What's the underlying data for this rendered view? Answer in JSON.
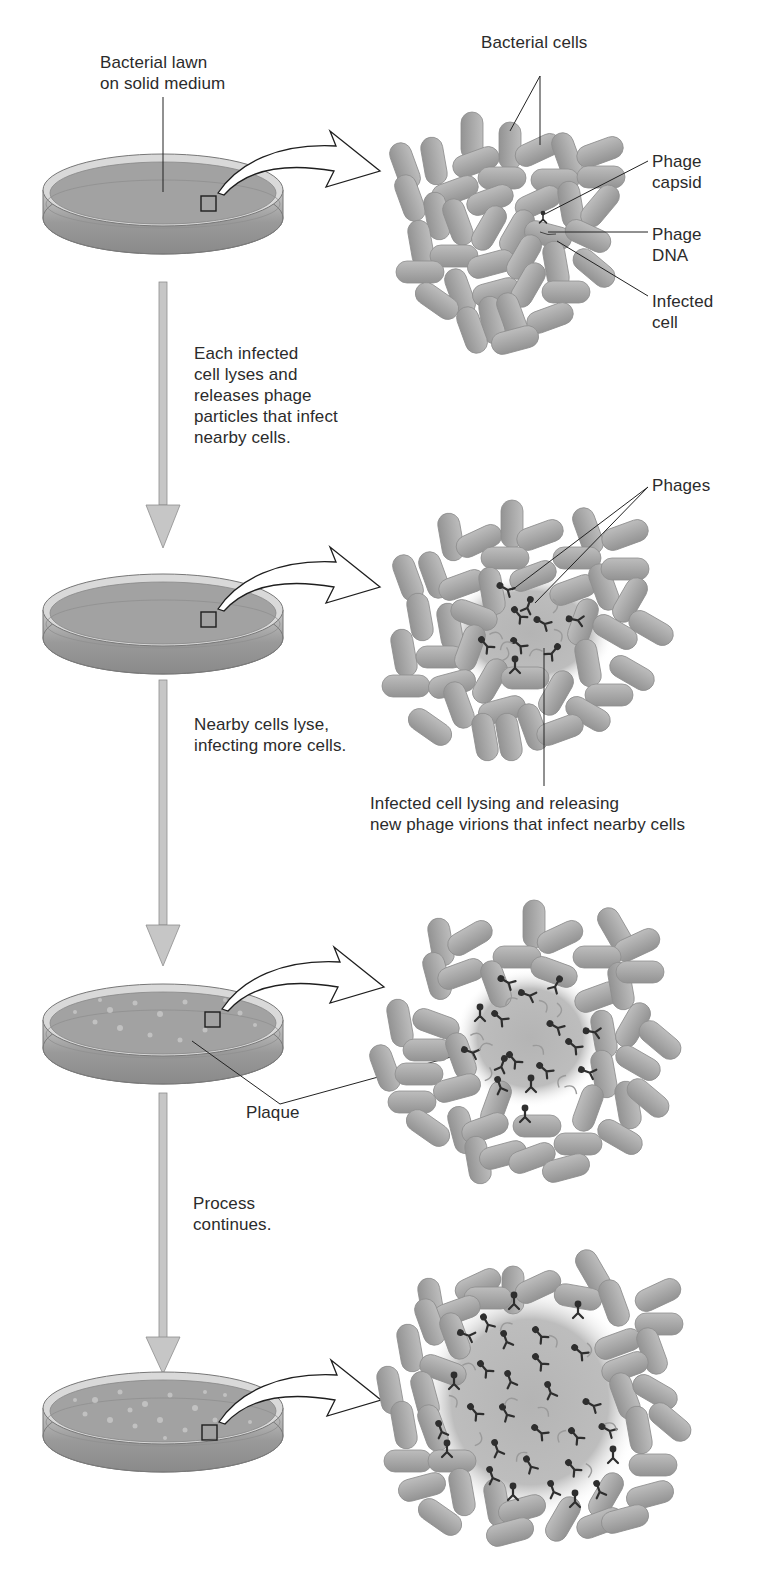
{
  "figure": {
    "colors": {
      "cell_fill": "#a9a9a9",
      "cell_edge": "#8a8a8a",
      "agar": "#9c9c9c",
      "dish_rim": "#cfcfcf",
      "plaque_halo": "#bdbdbd",
      "phage": "#2e2e2e",
      "arrow_fill": "#c4c4c4",
      "line": "#222222"
    },
    "steps": [
      {
        "id": "step1",
        "dish_label": "Bacterial lawn\non solid medium",
        "zoom_labels": [
          "Bacterial cells",
          "Phage\ncapsid",
          "Phage\nDNA",
          "Infected\ncell"
        ]
      },
      {
        "id": "step2",
        "transition_text": "Each infected\ncell lyses and\nreleases phage\nparticles that infect\nnearby cells.",
        "zoom_labels": [
          "Phages",
          "Infected cell lysing and releasing\nnew phage virions that infect nearby cells"
        ]
      },
      {
        "id": "step3",
        "transition_text": "Nearby cells lyse,\ninfecting more cells.",
        "dish_label": "Plaque"
      },
      {
        "id": "step4",
        "transition_text": "Process\ncontinues."
      }
    ]
  },
  "labels": {
    "bacterial_lawn": "Bacterial lawn\non solid medium",
    "bacterial_cells": "Bacterial cells",
    "phage_capsid": "Phage\ncapsid",
    "phage_dna": "Phage\nDNA",
    "infected_cell": "Infected\ncell",
    "each_infected": "Each infected\ncell lyses and\nreleases phage\nparticles that infect\nnearby cells.",
    "phages": "Phages",
    "nearby_cells": "Nearby cells lyse,\ninfecting more cells.",
    "infected_lysing": "Infected cell lysing and releasing\nnew phage virions that infect nearby cells",
    "plaque": "Plaque",
    "process_continues": "Process\ncontinues."
  }
}
